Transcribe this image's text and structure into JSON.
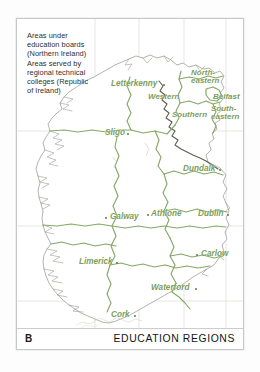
{
  "figure": {
    "panel_letter": "B",
    "title": "EDUCATION REGIONS"
  },
  "legend": {
    "lines": [
      "Areas under",
      "education boards",
      "(Northern Ireland)",
      "Areas served by",
      "regional technical",
      "colleges (Republic",
      "of Ireland)"
    ]
  },
  "colors": {
    "label_green": "#7d9e5c",
    "boundary_green": "#86a867",
    "coastline_gray": "#9a9a93",
    "border_dark": "#55594a",
    "graticule_gray": "#d2d2cc",
    "frame_gray": "#c9c9c9",
    "text_dark": "#1a1a1a"
  },
  "map": {
    "region_labels": [
      {
        "name": "north-eastern",
        "text_line1": "North-",
        "text_line2": "eastern",
        "x": 174,
        "y": 54
      },
      {
        "name": "belfast",
        "text_line1": "Belfast",
        "text_line2": "",
        "x": 196,
        "y": 76
      },
      {
        "name": "south-eastern",
        "text_line1": "South-",
        "text_line2": "eastern",
        "x": 194,
        "y": 88
      },
      {
        "name": "western",
        "text_line1": "Western",
        "text_line2": "",
        "x": 133,
        "y": 76
      },
      {
        "name": "southern",
        "text_line1": "Southern",
        "text_line2": "",
        "x": 157,
        "y": 92
      }
    ],
    "city_labels": [
      {
        "name": "letterkenny",
        "text": "Letterkenny",
        "x": 96,
        "y": 63,
        "dot_x": 146,
        "dot_y": 66,
        "dot_side": "right"
      },
      {
        "name": "sligo",
        "text": "Sligo",
        "x": 89,
        "y": 112,
        "dot_x": 112,
        "dot_y": 115,
        "dot_side": "right"
      },
      {
        "name": "dundalk",
        "text": "Dundalk",
        "x": 168,
        "y": 148,
        "dot_x": 203,
        "dot_y": 151,
        "dot_side": "right"
      },
      {
        "name": "athlone",
        "text": "Athlone",
        "x": 135,
        "y": 193,
        "dot_x": 131,
        "dot_y": 196,
        "dot_side": "left"
      },
      {
        "name": "dublin",
        "text": "Dublin",
        "x": 182,
        "y": 193,
        "dot_x": 211,
        "dot_y": 196,
        "dot_side": "right"
      },
      {
        "name": "galway",
        "text": "Galway",
        "x": 94,
        "y": 196,
        "dot_x": 90,
        "dot_y": 199,
        "dot_side": "left"
      },
      {
        "name": "limerick",
        "text": "Limerick",
        "x": 63,
        "y": 241,
        "dot_x": 100,
        "dot_y": 244,
        "dot_side": "right"
      },
      {
        "name": "carlow",
        "text": "Carlow",
        "x": 185,
        "y": 233,
        "dot_x": 181,
        "dot_y": 236,
        "dot_side": "left"
      },
      {
        "name": "waterford",
        "text": "Waterford",
        "x": 135,
        "y": 267,
        "dot_x": 179,
        "dot_y": 270,
        "dot_side": "right"
      },
      {
        "name": "cork",
        "text": "Cork",
        "x": 95,
        "y": 294,
        "dot_x": 118,
        "dot_y": 297,
        "dot_side": "right"
      }
    ],
    "graticule": {
      "vertical_x": [
        78,
        122,
        167,
        209
      ],
      "horizontal_y": [
        112,
        207,
        282
      ]
    }
  }
}
